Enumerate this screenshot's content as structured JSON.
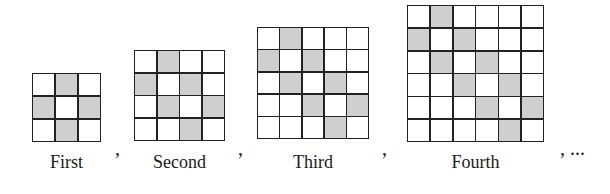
{
  "figures": [
    {
      "label": "First",
      "size": 3,
      "x": 32,
      "y": 73,
      "w": 69,
      "shaded": [
        [
          0,
          1
        ],
        [
          1,
          0
        ],
        [
          1,
          2
        ],
        [
          2,
          1
        ]
      ]
    },
    {
      "label": "Second",
      "size": 4,
      "x": 134,
      "y": 50,
      "w": 91,
      "shaded": [
        [
          0,
          1
        ],
        [
          1,
          0
        ],
        [
          1,
          2
        ],
        [
          2,
          1
        ],
        [
          2,
          3
        ],
        [
          3,
          2
        ]
      ]
    },
    {
      "label": "Third",
      "size": 5,
      "x": 257,
      "y": 27,
      "w": 112,
      "shaded": [
        [
          0,
          1
        ],
        [
          1,
          0
        ],
        [
          1,
          2
        ],
        [
          2,
          1
        ],
        [
          2,
          3
        ],
        [
          3,
          2
        ],
        [
          3,
          4
        ],
        [
          4,
          3
        ]
      ]
    },
    {
      "label": "Fourth",
      "size": 6,
      "x": 407,
      "y": 5,
      "w": 137,
      "shaded": [
        [
          0,
          1
        ],
        [
          1,
          0
        ],
        [
          1,
          2
        ],
        [
          2,
          1
        ],
        [
          2,
          3
        ],
        [
          3,
          2
        ],
        [
          3,
          4
        ],
        [
          4,
          3
        ],
        [
          4,
          5
        ],
        [
          5,
          4
        ]
      ]
    }
  ],
  "separators": [
    {
      "text": ",",
      "x": 115,
      "y": 138
    },
    {
      "text": ",",
      "x": 238,
      "y": 138
    },
    {
      "text": ",",
      "x": 382,
      "y": 138
    },
    {
      "text": ", ...",
      "x": 560,
      "y": 138
    }
  ],
  "colors": {
    "shaded": "#cfcfcf",
    "line": "#222222",
    "background": "#ffffff"
  }
}
